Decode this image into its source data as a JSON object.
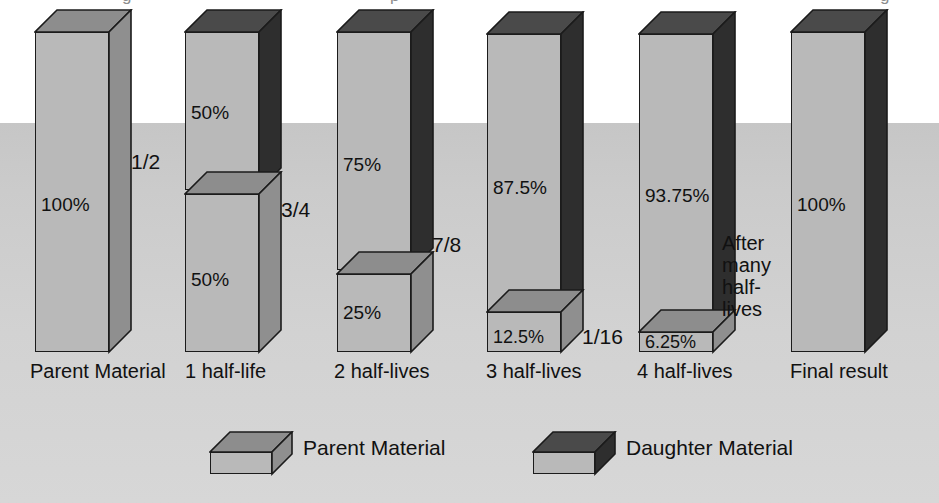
{
  "figure": {
    "background_color": "#c9c9c9",
    "page_color": "#ffffff"
  },
  "colors": {
    "parent_front": "#b9b9b9",
    "parent_side": "#8f8f8f",
    "parent_top": "#8d8d8d",
    "daughter_front": "#b9b9b9",
    "daughter_side": "#2e2e2e",
    "daughter_top": "#4a4a4a",
    "outline": "#1b1b1b",
    "text": "#111111"
  },
  "ghost_top_text": [
    {
      "text": "g",
      "x": 122
    },
    {
      "text": "p",
      "x": 390
    },
    {
      "text": "g",
      "x": 880
    }
  ],
  "chart_data": {
    "type": "bar",
    "xlabel": "",
    "ylabel": "",
    "ylim": [
      0,
      100
    ],
    "grid": false,
    "legend_position": "bottom",
    "categories": [
      "Parent Material",
      "1 half-life",
      "2 half-lives",
      "3 half-lives",
      "4 half-lives",
      "Final result"
    ],
    "series": [
      {
        "name": "Parent Material",
        "values": [
          100,
          50,
          25,
          12.5,
          6.25,
          0
        ]
      },
      {
        "name": "Daughter Material",
        "values": [
          0,
          50,
          75,
          87.5,
          93.75,
          100
        ]
      }
    ],
    "daughter_fraction_labels": [
      "1/2",
      "3/4",
      "7/8",
      "1/16"
    ],
    "parent_fraction_labels": [
      "1/2",
      "1/4",
      "1/8"
    ],
    "annotations": [
      "After many half-lives"
    ]
  },
  "bars": [
    {
      "id": "bar-parent-material",
      "x_label": "Parent Material",
      "label_x": 30,
      "left": 35,
      "width": 74,
      "depth": 22,
      "baseline": 352,
      "segments": [
        {
          "id": "parent",
          "material": "parent",
          "percent_label": "100%",
          "pct_top": 195,
          "height": 320,
          "offset": 0
        }
      ],
      "fractions": [
        {
          "text": "1/2",
          "x": 131,
          "y": 150
        },
        {
          "text": "1/2",
          "x": 218,
          "y": 325
        }
      ]
    },
    {
      "id": "bar-1-half-life",
      "x_label": "1 half-life",
      "label_x": 185,
      "left": 185,
      "width": 74,
      "depth": 22,
      "baseline": 352,
      "segments": [
        {
          "id": "daughter",
          "material": "daughter",
          "percent_label": "50%",
          "pct_top": 103,
          "height": 158,
          "offset": 162
        },
        {
          "id": "parent",
          "material": "parent",
          "percent_label": "50%",
          "pct_top": 270,
          "height": 158,
          "offset": 0
        }
      ],
      "fractions": [
        {
          "text": "3/4",
          "x": 281,
          "y": 198
        },
        {
          "text": "1/4",
          "x": 369,
          "y": 325
        }
      ]
    },
    {
      "id": "bar-2-half-lives",
      "x_label": "2 half-lives",
      "label_x": 334,
      "left": 337,
      "width": 74,
      "depth": 22,
      "baseline": 352,
      "segments": [
        {
          "id": "daughter",
          "material": "daughter",
          "percent_label": "75%",
          "pct_top": 155,
          "height": 238,
          "offset": 82
        },
        {
          "id": "parent",
          "material": "parent",
          "percent_label": "25%",
          "pct_top": 303,
          "height": 78,
          "offset": 0
        }
      ],
      "fractions": [
        {
          "text": "7/8",
          "x": 432,
          "y": 233
        },
        {
          "text": "1/8",
          "x": 520,
          "y": 325
        }
      ]
    },
    {
      "id": "bar-3-half-lives",
      "x_label": "3 half-lives",
      "label_x": 486,
      "left": 487,
      "width": 74,
      "depth": 22,
      "baseline": 352,
      "segments": [
        {
          "id": "daughter",
          "material": "daughter",
          "percent_label": "87.5%",
          "pct_top": 178,
          "height": 278,
          "offset": 40
        },
        {
          "id": "parent",
          "material": "parent",
          "percent_label": "12.5%",
          "pct_top": 328,
          "height": 40,
          "offset": 0
        }
      ],
      "fractions": [
        {
          "text": "1/16",
          "x": 582,
          "y": 325
        }
      ]
    },
    {
      "id": "bar-4-half-lives",
      "x_label": "4 half-lives",
      "label_x": 637,
      "left": 639,
      "width": 74,
      "depth": 22,
      "baseline": 352,
      "segments": [
        {
          "id": "daughter",
          "material": "daughter",
          "percent_label": "93.75%",
          "pct_top": 186,
          "height": 298,
          "offset": 20
        },
        {
          "id": "parent",
          "material": "parent",
          "percent_label": "6.25%",
          "pct_top": 333,
          "height": 20,
          "offset": 0
        }
      ],
      "fractions": []
    },
    {
      "id": "bar-final-result",
      "x_label": "Final result",
      "label_x": 790,
      "left": 791,
      "width": 74,
      "depth": 22,
      "baseline": 352,
      "segments": [
        {
          "id": "daughter",
          "material": "daughter",
          "percent_label": "100%",
          "pct_top": 195,
          "height": 320,
          "offset": 0
        }
      ],
      "fractions": []
    }
  ],
  "side_annotation": {
    "lines": [
      "After",
      "many",
      "half-",
      "lives"
    ],
    "x": 722,
    "y": 232
  },
  "x_labels_y": 360,
  "legend": {
    "items": [
      {
        "id": "legend-parent",
        "label": "Parent Material",
        "material": "parent",
        "box_x": 210,
        "box_y": 432,
        "label_x": 303,
        "label_y": 436
      },
      {
        "id": "legend-daughter",
        "label": "Daughter Material",
        "material": "daughter",
        "box_x": 533,
        "box_y": 432,
        "label_x": 626,
        "label_y": 436
      }
    ]
  }
}
